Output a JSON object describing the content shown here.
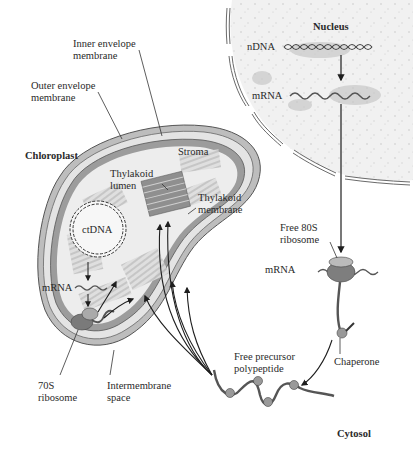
{
  "diagram": {
    "type": "cell-biology-schematic",
    "colors": {
      "membrane_dark": "#8a8a8a",
      "membrane_light": "#c8c8c8",
      "stroma": "#ececec",
      "thylakoid": "#a8a8a8",
      "nucleus_fill": "#efefef",
      "arrow": "#1e1e1e",
      "text": "#2a2a2a"
    },
    "regions": {
      "nucleus": "Nucleus",
      "chloroplast": "Chloroplast",
      "cytosol": "Cytosol"
    },
    "labels": {
      "inner_envelope": [
        "Inner envelope",
        "membrane"
      ],
      "outer_envelope": [
        "Outer envelope",
        "membrane"
      ],
      "stroma": "Stroma",
      "thylakoid_lumen": [
        "Thylakoid",
        "lumen"
      ],
      "thylakoid_membrane": [
        "Thylakoid",
        "membrane"
      ],
      "ctdna": "ctDNA",
      "chloroplast_mrna": "mRNA",
      "ribosome_70s": [
        "70S",
        "ribosome"
      ],
      "intermembrane_space": [
        "Intermembrane",
        "space"
      ],
      "ndna": "nDNA",
      "nuclear_mrna": "mRNA",
      "free_80s_ribosome": [
        "Free 80S",
        "ribosome"
      ],
      "cytosol_mrna": "mRNA",
      "chaperone": "Chaperone",
      "free_precursor": [
        "Free precursor",
        "polypeptide"
      ]
    },
    "flow": [
      "nDNA → mRNA (transcription in nucleus)",
      "mRNA → Free 80S ribosome (export to cytosol)",
      "Free 80S ribosome → Free precursor polypeptide (with chaperone)",
      "Free precursor polypeptide → Chloroplast (import into stroma / thylakoid)",
      "ctDNA → mRNA → 70S ribosome (chloroplast translation)"
    ]
  }
}
